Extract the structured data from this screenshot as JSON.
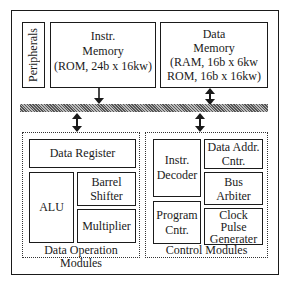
{
  "diagram": {
    "blocks": {
      "peripherals": "Peripherals",
      "instr_memory": "Instr.\nMemory\n(ROM, 24b x 16kw)",
      "data_memory": "Data\nMemory\n(RAM, 16b x 6kw\nROM, 16b x 16kw)",
      "data_register": "Data Register",
      "alu": "ALU",
      "barrel_shifter": "Barrel\nShifter",
      "multiplier": "Multiplier",
      "instr_decoder": "Instr.\nDecoder",
      "program_counter": "Program\nCntr.",
      "data_addr_counter": "Data Addr.\nCntr.",
      "bus_arbiter": "Bus\nArbiter",
      "clock_pulse_generator": "Clock\nPulse\nGenerater"
    },
    "groups": {
      "data_operation": "Data Operation Modules",
      "control": "Control Modules"
    },
    "connections": [
      {
        "from": "instr_memory",
        "to": "bus",
        "type": "unidirectional"
      },
      {
        "from": "data_memory",
        "to": "bus",
        "type": "bidirectional"
      },
      {
        "from": "bus",
        "to": "data_operation",
        "type": "bidirectional"
      },
      {
        "from": "bus",
        "to": "control",
        "type": "bidirectional"
      }
    ]
  }
}
